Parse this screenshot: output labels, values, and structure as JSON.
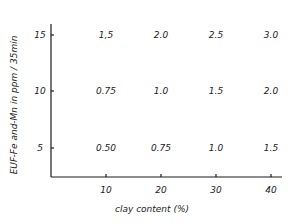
{
  "chart_data": {
    "type": "table",
    "title": "",
    "xlabel": "clay content (%)",
    "ylabel": "EUF-Fe and-Mn in ppm / 35min",
    "x_ticks": [
      "10",
      "20",
      "30",
      "40"
    ],
    "y_ticks": [
      "5",
      "10",
      "15"
    ],
    "x": [
      10,
      20,
      30,
      40
    ],
    "grid": false,
    "legend": null,
    "series": [
      {
        "name": "15",
        "y": 15,
        "values": [
          "1.5",
          "2.0",
          "2.5",
          "3.0"
        ]
      },
      {
        "name": "10",
        "y": 10,
        "values": [
          "0.75",
          "1.0",
          "1.5",
          "2.0"
        ]
      },
      {
        "name": "5",
        "y": 5,
        "values": [
          "0.50",
          "0.75",
          "1.0",
          "1.5"
        ]
      }
    ],
    "cell_labels": [
      [
        "1,5",
        "2.0",
        "2.5",
        "3.0"
      ],
      [
        "0.75",
        "1.0",
        "1.5",
        "2.0"
      ],
      [
        "0.50",
        "0.75",
        "1.0",
        "1.5"
      ]
    ]
  },
  "layout": {
    "axis_color": "#1a1a1a",
    "x_axis_px": {
      "x0": 51,
      "x1": 282,
      "y": 177
    },
    "y_axis_px": {
      "x": 51,
      "y0": 24,
      "y1": 177
    },
    "x_tick_px": [
      106,
      161,
      216,
      271
    ],
    "y_tick_px": [
      148,
      91,
      35
    ]
  }
}
